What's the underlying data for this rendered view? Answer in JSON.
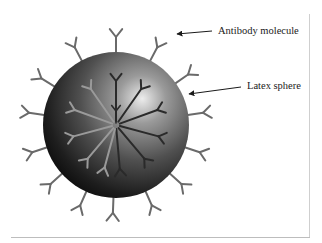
{
  "figure": {
    "labels": {
      "antibody": "Antibody molecule",
      "latex": "Latex sphere"
    },
    "colors": {
      "background": "#ffffff",
      "sphere_dark": "#111111",
      "sphere_mid": "#555555",
      "sphere_highlight": "#e8e8e8",
      "antibody_outer": "#6a6a6a",
      "antibody_inner_dark": "#2a2a2a",
      "antibody_inner_light": "#9a9a9a",
      "arrow": "#1a1a1a",
      "frame": "#c8c8c8"
    },
    "sphere": {
      "cx": 116,
      "cy": 125,
      "r": 73
    },
    "outer_antibody_angles_deg": [
      -90,
      -62,
      -118,
      -35,
      -148,
      -8,
      -172,
      18,
      162,
      42,
      138,
      66,
      114,
      92
    ],
    "inner_antibody_angles_deg": [
      -90,
      -55,
      -125,
      -20,
      -160,
      15,
      165,
      50,
      130,
      85,
      105
    ]
  }
}
